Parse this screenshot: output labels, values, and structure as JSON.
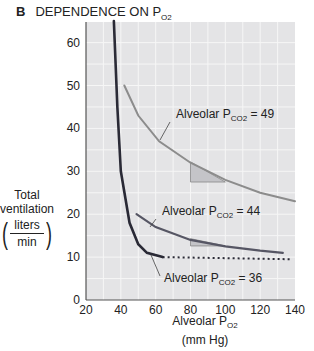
{
  "header": {
    "panel_letter": "B",
    "title": "DEPENDENCE ON P",
    "title_sub": "O2"
  },
  "y_axis": {
    "label_line1": "Total",
    "label_line2": "ventilation",
    "unit_num": "liters",
    "unit_den": "min"
  },
  "x_axis": {
    "label": "Alveolar P",
    "label_sub": "O2",
    "unit": "(mm Hg)"
  },
  "chart_data": {
    "type": "line",
    "title": "DEPENDENCE ON PO2",
    "xlabel": "Alveolar PO2 (mm Hg)",
    "ylabel": "Total ventilation (liters/min)",
    "xlim": [
      20,
      140
    ],
    "ylim": [
      0,
      65
    ],
    "xticks": [
      20,
      40,
      60,
      80,
      100,
      120,
      140
    ],
    "yticks": [
      0,
      10,
      20,
      30,
      40,
      50,
      60
    ],
    "grid": true,
    "series": [
      {
        "name": "Alveolar PCO2 = 49",
        "label": "Alveolar P",
        "sub": "CO2",
        "value_text": "= 49",
        "color": "#8c8c8c",
        "x": [
          42,
          50,
          62,
          80,
          100,
          120,
          140
        ],
        "y": [
          50,
          43,
          37,
          32,
          28,
          25,
          23
        ]
      },
      {
        "name": "Alveolar PCO2 = 44",
        "label": "Alveolar P",
        "sub": "CO2",
        "value_text": "= 44",
        "color": "#565664",
        "x": [
          49,
          60,
          80,
          100,
          120,
          133
        ],
        "y": [
          20,
          17,
          14,
          12.5,
          11.5,
          11
        ]
      },
      {
        "name": "Alveolar PCO2 = 36",
        "label": "Alveolar P",
        "sub": "CO2",
        "value_text": "= 36",
        "color": "#2a2a36",
        "x": [
          36,
          38,
          40,
          45,
          50,
          55,
          64
        ],
        "y": [
          65,
          45,
          30,
          18,
          13,
          11,
          10
        ],
        "dotted_extension": {
          "x": [
            64,
            137
          ],
          "y": [
            10,
            9.5
          ]
        }
      }
    ]
  }
}
